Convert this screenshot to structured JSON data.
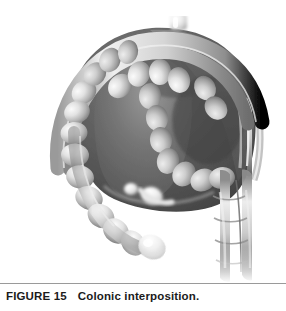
{
  "figure": {
    "caption_label": "FIGURE 15",
    "caption_title": "Colonic interposition.",
    "illustration": {
      "name": "colonic-interposition-illustration",
      "style": "grayscale airbrush medical illustration",
      "background_color": "#ffffff",
      "subject": "Interposed colon segment forming an inverted-U loop anterior to the abdominal organs",
      "parts": [
        {
          "name": "proximal-anastomosis-stub",
          "label": "proximal anastomosis stub",
          "tone": "#e8e8e8"
        },
        {
          "name": "transverse-colon-arch",
          "label": "transverse colon arch",
          "tone": "#8f8f8f"
        },
        {
          "name": "haustral-segments",
          "label": "haustra",
          "tone": "#d2d2d2"
        },
        {
          "name": "left-descending-limb",
          "label": "left descending colon limb",
          "tone": "#c4c4c4"
        },
        {
          "name": "right-descending-limb",
          "label": "right descending colon limb",
          "tone": "#b8b8b8"
        },
        {
          "name": "dark-organ-mass",
          "label": "stomach and liver mass",
          "tone": "#5a5a5a"
        },
        {
          "name": "pale-conduit-tube",
          "label": "interposed conduit tube",
          "tone": "#dcdcdc"
        },
        {
          "name": "distal-bulb",
          "label": "distal colonic bulb",
          "tone": "#ededed"
        },
        {
          "name": "mesenteric-band",
          "label": "mesenteric vascular band",
          "tone": "#a8a8a8"
        }
      ]
    }
  },
  "colors": {
    "page_background": "#ffffff",
    "rule": "#9a9a9a",
    "caption_text": "#1b1b1b",
    "organ_dark": "#4e4e4e",
    "organ_mid": "#7c7c7c",
    "bowel_light": "#dcdcdc",
    "bowel_shadow": "#8c8c8c"
  }
}
